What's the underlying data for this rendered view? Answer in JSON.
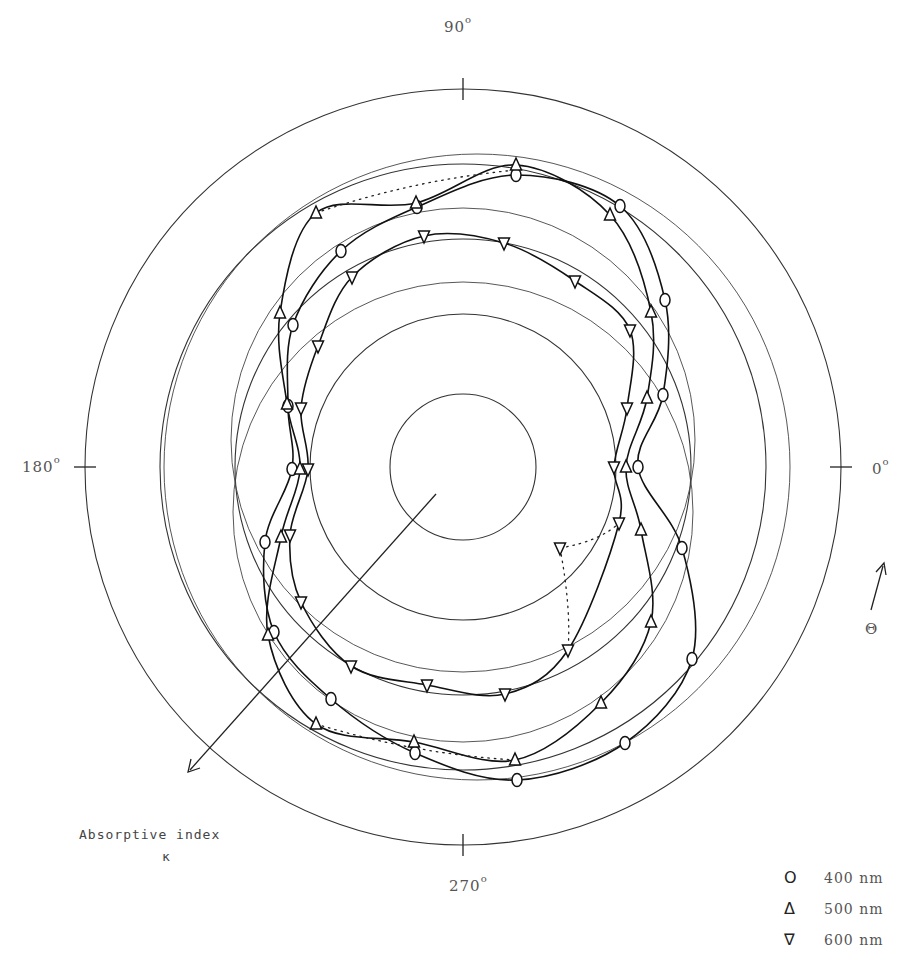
{
  "chart_data": {
    "type": "polar",
    "title": "",
    "angle_labels": [
      {
        "angle": 90,
        "text": "90",
        "unit": "o"
      },
      {
        "angle": 180,
        "text": "180",
        "unit": "o"
      },
      {
        "angle": 0,
        "text": "0",
        "unit": "o"
      },
      {
        "angle": 270,
        "text": "270",
        "unit": "o"
      }
    ],
    "theta_label": "Θ",
    "radial_axis_label": "Absorptive index",
    "radial_axis_symbol": "κ",
    "center": [
      463,
      467
    ],
    "reference_circle_radii_px": [
      73,
      153,
      228,
      303,
      378
    ],
    "legend": [
      {
        "marker": "circle",
        "symbol": "O",
        "label": "400 nm"
      },
      {
        "marker": "triangle-up",
        "symbol": "Δ",
        "label": "500 nm"
      },
      {
        "marker": "triangle-down",
        "symbol": "∇",
        "label": "600 nm"
      }
    ],
    "series": [
      {
        "name": "400 nm",
        "marker": "circle",
        "points_px": [
          [
            516,
            175
          ],
          [
            620,
            206
          ],
          [
            665,
            300
          ],
          [
            663,
            395
          ],
          [
            638,
            467
          ],
          [
            682,
            548
          ],
          [
            692,
            659
          ],
          [
            625,
            743
          ],
          [
            517,
            780
          ],
          [
            415,
            753
          ],
          [
            331,
            699
          ],
          [
            274,
            632
          ],
          [
            265,
            542
          ],
          [
            292,
            469
          ],
          [
            288,
            406
          ],
          [
            293,
            325
          ],
          [
            341,
            251
          ],
          [
            417,
            207
          ]
        ]
      },
      {
        "name": "500 nm",
        "marker": "triangle-up",
        "points_px": [
          [
            516,
            165
          ],
          [
            610,
            215
          ],
          [
            651,
            312
          ],
          [
            647,
            398
          ],
          [
            626,
            467
          ],
          [
            641,
            530
          ],
          [
            651,
            622
          ],
          [
            601,
            703
          ],
          [
            515,
            760
          ],
          [
            414,
            742
          ],
          [
            316,
            724
          ],
          [
            268,
            635
          ],
          [
            281,
            537
          ],
          [
            300,
            469
          ],
          [
            287,
            404
          ],
          [
            280,
            313
          ],
          [
            316,
            213
          ],
          [
            416,
            203
          ]
        ]
      },
      {
        "name": "600 nm",
        "marker": "triangle-down",
        "points_px": [
          [
            424,
            236
          ],
          [
            504,
            243
          ],
          [
            575,
            281
          ],
          [
            630,
            330
          ],
          [
            627,
            408
          ],
          [
            614,
            467
          ],
          [
            619,
            523
          ],
          [
            568,
            650
          ],
          [
            505,
            694
          ],
          [
            427,
            685
          ],
          [
            351,
            666
          ],
          [
            301,
            602
          ],
          [
            290,
            535
          ],
          [
            308,
            469
          ],
          [
            301,
            408
          ],
          [
            318,
            346
          ],
          [
            352,
            277
          ],
          [
            560,
            548
          ]
        ]
      }
    ],
    "dotted_segments": [
      {
        "series": "400 nm/500 nm",
        "from": [
          316,
          213
        ],
        "to": [
          516,
          170
        ]
      },
      {
        "series": "500 nm",
        "from": [
          316,
          724
        ],
        "to": [
          515,
          760
        ]
      },
      {
        "series": "600 nm",
        "from": [
          560,
          548
        ],
        "to": [
          619,
          523
        ]
      },
      {
        "series": "600 nm",
        "from": [
          560,
          548
        ],
        "to": [
          568,
          650
        ]
      }
    ]
  },
  "labels": {
    "deg90": "90",
    "deg180": "180",
    "deg0": "0",
    "deg270": "270",
    "degree_sup": "o",
    "theta": "Θ",
    "absorptive_index": "Absorptive index",
    "kappa": "κ"
  },
  "legend": {
    "items": [
      {
        "symbol": "O",
        "label": "400 nm"
      },
      {
        "symbol": "Δ",
        "label": "500 nm"
      },
      {
        "symbol": "∇",
        "label": "600 nm"
      }
    ]
  }
}
